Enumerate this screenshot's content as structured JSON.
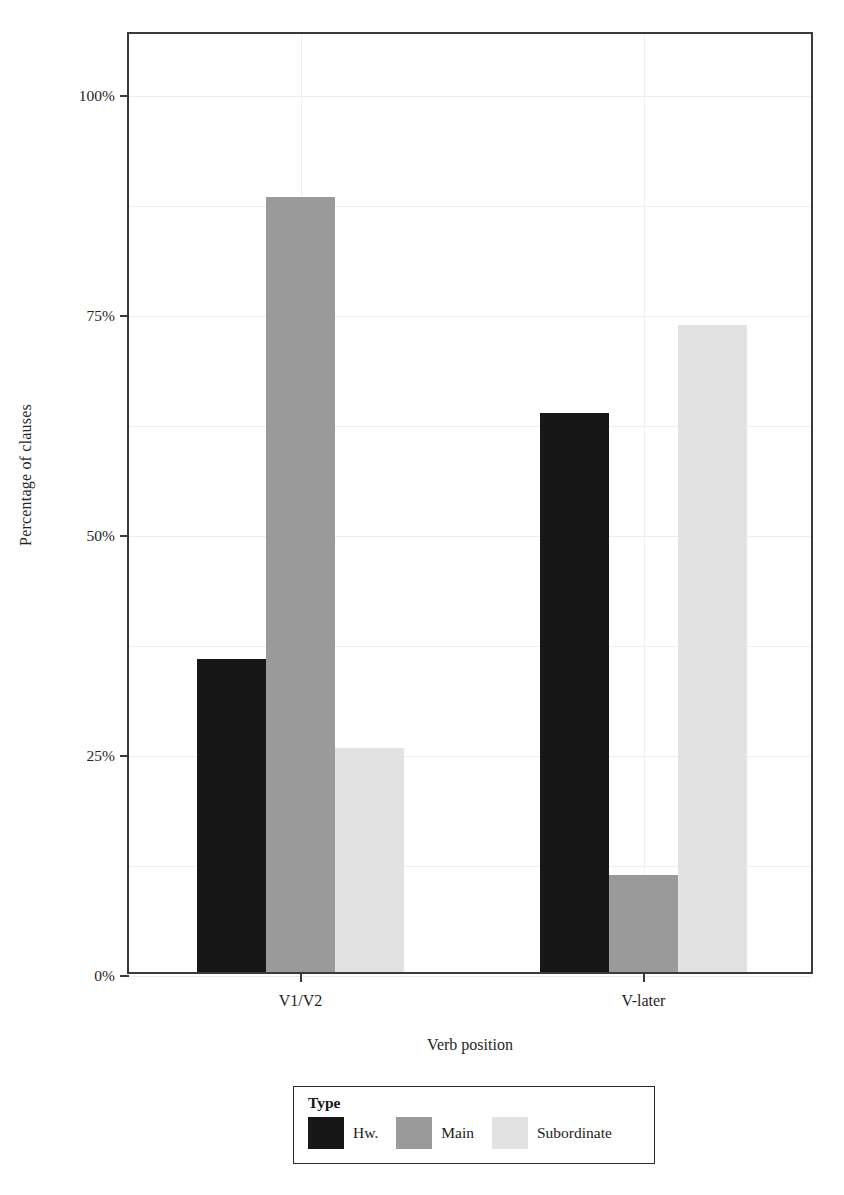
{
  "chart_data": {
    "type": "bar",
    "title": "",
    "xlabel": "Verb position",
    "ylabel": "Percentage of clauses",
    "categories": [
      "V1/V2",
      "V-later"
    ],
    "series": [
      {
        "name": "Hw.",
        "color": "#171717",
        "values": [
          35.5,
          63.5
        ]
      },
      {
        "name": "Main",
        "color": "#9a9a9a",
        "values": [
          88.0,
          11.0
        ]
      },
      {
        "name": "Subordinate",
        "color": "#e2e2e2",
        "values": [
          25.5,
          73.5
        ]
      }
    ],
    "ylim": [
      0,
      107
    ],
    "ytick_values": [
      0,
      25,
      50,
      75,
      100
    ],
    "ytick_labels": [
      "0%",
      "25%",
      "50%",
      "75%",
      "100%"
    ],
    "minor_gridline_values": [
      12.5,
      37.5,
      62.5,
      87.5
    ],
    "grid": true,
    "legend": {
      "title": "Type",
      "position": "bottom",
      "entries": [
        "Hw.",
        "Main",
        "Subordinate"
      ]
    }
  },
  "axis": {
    "y_title": "Percentage of clauses",
    "x_title": "Verb position",
    "y_labels": [
      "100%",
      "75%",
      "50%",
      "25%",
      "0%"
    ],
    "x_labels": [
      "V1/V2",
      "V-later"
    ]
  },
  "legend": {
    "title": "Type",
    "items": [
      {
        "label": "Hw.",
        "color": "#171717"
      },
      {
        "label": "Main",
        "color": "#9a9a9a"
      },
      {
        "label": "Subordinate",
        "color": "#e2e2e2"
      }
    ]
  }
}
